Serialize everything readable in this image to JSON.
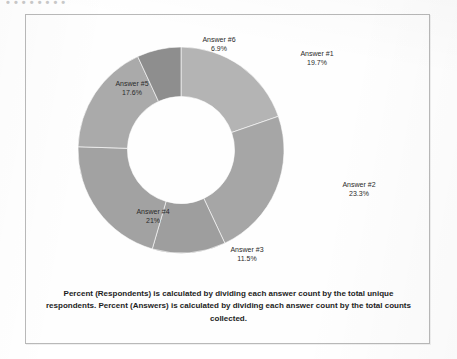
{
  "scan": {
    "top_cutoff_text": "• • • • • • • •"
  },
  "caption": {
    "text": "Percent (Respondents) is calculated by dividing each answer count by the total unique respondents. Percent (Answers) is calculated by dividing each answer count by the total counts collected."
  },
  "chart_data": {
    "type": "pie",
    "variant": "donut",
    "title": "",
    "xlabel": "",
    "ylabel": "",
    "legend_position": "none",
    "labels_inline": true,
    "value_unit": "%",
    "start_angle_deg": 0,
    "direction": "clockwise",
    "inner_radius_ratio": 0.52,
    "categories": [
      "Answer #1",
      "Answer #2",
      "Answer #3",
      "Answer #4",
      "Answer #5",
      "Answer #6"
    ],
    "values": [
      19.7,
      23.3,
      11.5,
      21,
      17.6,
      6.9
    ],
    "value_labels": [
      "19.7%",
      "23.3%",
      "11.5%",
      "21%",
      "17.6%",
      "6.9%"
    ],
    "colors": [
      "#b4b4b4",
      "#a6a6a6",
      "#9e9e9e",
      "#a2a2a2",
      "#aaaaaa",
      "#8e8e8e"
    ],
    "slices": [
      {
        "name": "Answer #1",
        "value": 19.7,
        "value_label": "19.7%",
        "color": "#b4b4b4"
      },
      {
        "name": "Answer #2",
        "value": 23.3,
        "value_label": "23.3%",
        "color": "#a6a6a6"
      },
      {
        "name": "Answer #3",
        "value": 11.5,
        "value_label": "11.5%",
        "color": "#9e9e9e"
      },
      {
        "name": "Answer #4",
        "value": 21,
        "value_label": "21%",
        "color": "#a2a2a2"
      },
      {
        "name": "Answer #5",
        "value": 17.6,
        "value_label": "17.6%",
        "color": "#aaaaaa"
      },
      {
        "name": "Answer #6",
        "value": 6.9,
        "value_label": "6.9%",
        "color": "#8e8e8e"
      }
    ]
  }
}
